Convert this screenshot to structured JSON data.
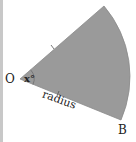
{
  "diagram": {
    "type": "circular-sector",
    "labels": {
      "center": "O",
      "angle": "x°",
      "radius": "radius",
      "endpoint": "B"
    },
    "colors": {
      "sector_fill": "#9a9a9a",
      "sector_stroke": "#8a8a8a",
      "text": "#222222",
      "left_border": "#c8c8c8"
    }
  }
}
